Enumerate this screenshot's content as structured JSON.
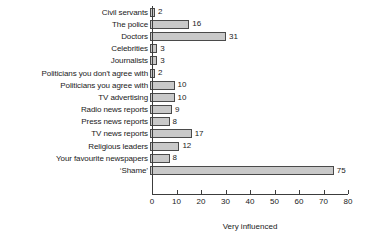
{
  "chart_data": {
    "type": "bar",
    "orientation": "horizontal",
    "title": "",
    "xlabel": "Very influenced",
    "ylabel": "",
    "xlim": [
      0,
      80
    ],
    "xticks": [
      0,
      10,
      20,
      30,
      40,
      50,
      60,
      70,
      80
    ],
    "grid": false,
    "legend": false,
    "bar_color": "#c9c9c9",
    "bar_border_color": "#4a4a4a",
    "background": "#ffffff",
    "text_color": "#1a1a1a",
    "categories": [
      "Civil servants",
      "The police",
      "Doctors",
      "Celebrities",
      "Journalists",
      "Politicians you don't agree with",
      "Politicians you agree with",
      "TV advertising",
      "Radio news reports",
      "Press news reports",
      "TV news reports",
      "Religious leaders",
      "Your favourite newspapers",
      "‘Shame’"
    ],
    "values": [
      2,
      16,
      31,
      3,
      3,
      2,
      10,
      10,
      9,
      8,
      17,
      12,
      8,
      75
    ],
    "value_labels": [
      "2",
      "16",
      "31",
      "3",
      "3",
      "2",
      "10",
      "10",
      "9",
      "8",
      "17",
      "12",
      "8",
      "75"
    ],
    "xtick_labels": [
      "0",
      "10",
      "20",
      "30",
      "40",
      "50",
      "60",
      "70",
      "80"
    ]
  }
}
